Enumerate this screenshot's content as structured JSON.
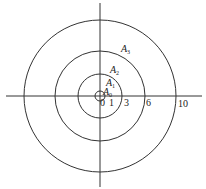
{
  "diagram": {
    "type": "concentric-circles",
    "center": [
      100,
      96
    ],
    "circles": [
      {
        "name": "r1",
        "radius_px": 5
      },
      {
        "name": "r3",
        "radius_px": 22
      },
      {
        "name": "r6",
        "radius_px": 45
      },
      {
        "name": "r10",
        "radius_px": 76
      }
    ],
    "region_labels": [
      {
        "main": "A",
        "sub": "0"
      },
      {
        "main": "A",
        "sub": "1"
      },
      {
        "main": "A",
        "sub": "2"
      },
      {
        "main": "A",
        "sub": "3"
      }
    ],
    "axis_ticks": [
      "0",
      "1",
      "3",
      "6",
      "10"
    ],
    "stroke_color": "#333333"
  }
}
